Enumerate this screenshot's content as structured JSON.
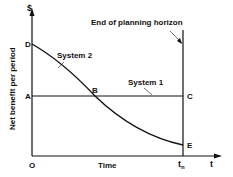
{
  "diagram": {
    "y_axis_symbol": "$",
    "y_axis_label": "Net benefit per period",
    "x_axis_symbol": "t",
    "x_axis_label": "Time",
    "origin_label": "O",
    "tn_label": "t",
    "tn_sub": "n",
    "horizon_label": "End of planning horizon",
    "system1_label": "System 1",
    "system2_label": "System 2",
    "points": {
      "A": "A",
      "B": "B",
      "C": "C",
      "D": "D",
      "E": "E"
    }
  }
}
